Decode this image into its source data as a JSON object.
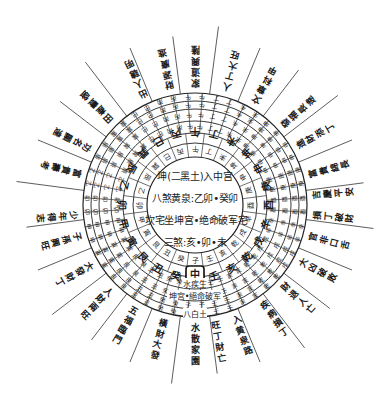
{
  "center": {
    "line1": "坤(二黑土)入中宫",
    "line2": "八煞黄泉:乙卯•癸卯",
    "line3": "坎宅坐坤宫•绝命破军宅",
    "line4": "三煞:亥•卯•未"
  },
  "geometry": {
    "cx": 195,
    "cy": 205,
    "inner_r": 48,
    "ring_radii": [
      48,
      62,
      72,
      84,
      96,
      104,
      112
    ],
    "spoke_outer_r": 180
  },
  "inner_ring_mountains": [
    "子",
    "癸",
    "丑",
    "艮",
    "寅",
    "甲",
    "卯",
    "乙",
    "辰",
    "巽",
    "巳",
    "丙",
    "午",
    "丁",
    "未",
    "坤",
    "申",
    "庚",
    "酉",
    "辛",
    "戌",
    "乾",
    "亥",
    "壬"
  ],
  "highlighted_mountain": "中",
  "bottom_labels": {
    "ring_a": "水疾生",
    "ring_b": "坤宫•絕命破军",
    "ring_c": "八白土"
  },
  "outer_spokes": [
    {
      "angle": 180,
      "text": "水散家園"
    },
    {
      "angle": 170,
      "text": "旺丁財亡"
    },
    {
      "angle": 160,
      "text": "入黄泉路"
    },
    {
      "angle": 145,
      "text": "疾病損丁"
    },
    {
      "angle": 132,
      "text": "財退人亡"
    },
    {
      "angle": 118,
      "text": "大凶破敗"
    },
    {
      "angle": 105,
      "text": "官非口舌"
    },
    {
      "angle": 95,
      "text": "損丁破財"
    },
    {
      "angle": 85,
      "text": "吉慶平安"
    },
    {
      "angle": 75,
      "text": "富貴綿長"
    },
    {
      "angle": 60,
      "text": "進財添丁"
    },
    {
      "angle": 48,
      "text": "發福長遠"
    },
    {
      "angle": 30,
      "text": "文章科甲"
    },
    {
      "angle": 15,
      "text": "人丁大旺"
    },
    {
      "angle": 0,
      "text": "家道興隆"
    },
    {
      "angle": -12,
      "text": "財源廣進"
    },
    {
      "angle": -25,
      "text": "出人聰明"
    },
    {
      "angle": -45,
      "text": "田產豐盛"
    },
    {
      "angle": -62,
      "text": "功名顯達"
    },
    {
      "angle": -75,
      "text": "富貴壽考"
    },
    {
      "angle": -95,
      "text": "少年得志"
    },
    {
      "angle": -105,
      "text": "子孫興旺"
    },
    {
      "angle": -120,
      "text": "大發財丁"
    },
    {
      "angle": -135,
      "text": "人財兩旺"
    },
    {
      "angle": -150,
      "text": "五福臨門"
    },
    {
      "angle": -165,
      "text": "橫財大發"
    }
  ]
}
